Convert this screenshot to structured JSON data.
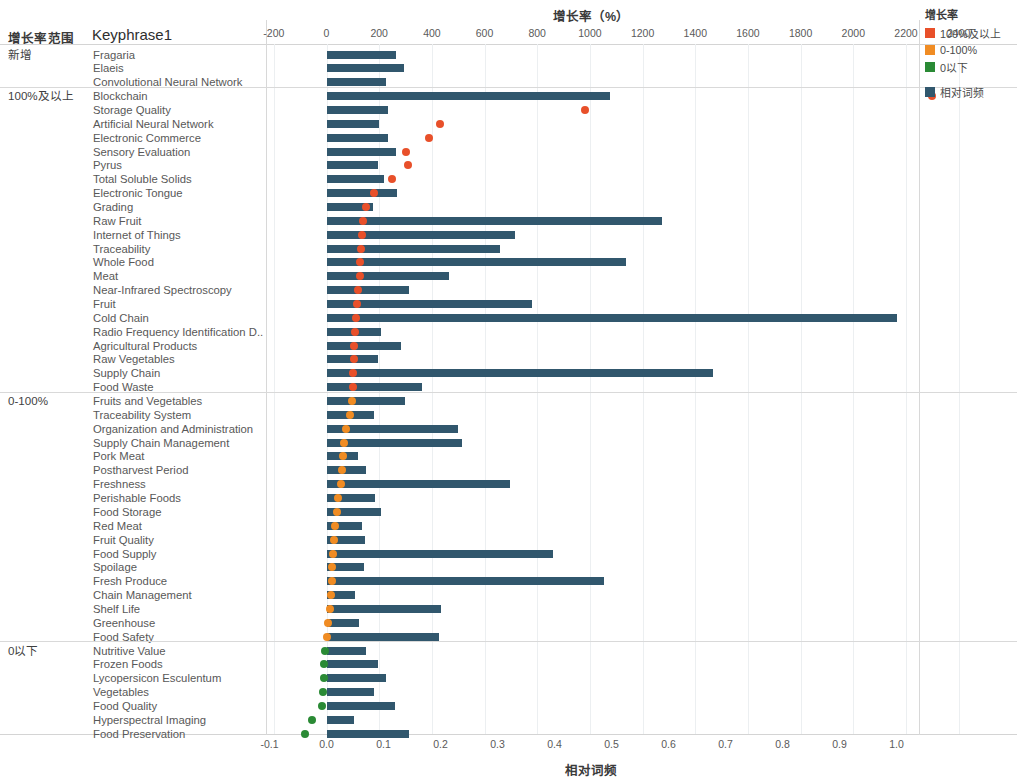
{
  "header": {
    "group_column_title": "增长率范围",
    "keyphrase_column_title": "Keyphrase1"
  },
  "legend": {
    "title": "增长率",
    "items": [
      {
        "label": "100%及以上",
        "color": "#e8502a"
      },
      {
        "label": "0-100%",
        "color": "#f08c23"
      },
      {
        "label": "0以下",
        "color": "#2a8a35"
      },
      {
        "label": "相对词频",
        "color": "#31576d"
      }
    ]
  },
  "chart_data": {
    "type": "bar",
    "title": "",
    "xlabel": "相对词频",
    "x2label": "增长率（%）",
    "ylabel": "Keyphrase1",
    "grid": true,
    "legend_position": "right",
    "top_axis": {
      "title": "增长率（%）",
      "ticks": [
        -200,
        0,
        200,
        400,
        600,
        800,
        1000,
        1200,
        1400,
        1600,
        1800,
        2000,
        2200,
        2400
      ],
      "tick_labels": [
        "-200",
        "0",
        "200",
        "400",
        "600",
        "800",
        "1000",
        "1200",
        "1400",
        "1600",
        "1800",
        "2000",
        "2200",
        "2400"
      ],
      "range": [
        -200,
        2400
      ]
    },
    "bottom_axis": {
      "title": "相对词频",
      "ticks": [
        -0.1,
        0.0,
        0.1,
        0.2,
        0.3,
        0.4,
        0.5,
        0.6,
        0.7,
        0.8,
        0.9,
        1.0
      ],
      "tick_labels": [
        "-0.1",
        "0.0",
        "0.1",
        "0.2",
        "0.3",
        "0.4",
        "0.5",
        "0.6",
        "0.7",
        "0.8",
        "0.9",
        "1.0"
      ],
      "range": [
        -0.1,
        1.0
      ]
    },
    "series": [
      {
        "name": "相对词频",
        "type": "bar",
        "color": "#31576d"
      },
      {
        "name": "增长率",
        "type": "scatter"
      }
    ],
    "groups": [
      {
        "label": "新增",
        "rows": [
          {
            "keyphrase": "Fragaria",
            "freq": 0.122,
            "growth": null,
            "growth_class": "new"
          },
          {
            "keyphrase": "Elaeis",
            "freq": 0.135,
            "growth": null,
            "growth_class": "new"
          },
          {
            "keyphrase": "Convolutional Neural Network",
            "freq": 0.104,
            "growth": null,
            "growth_class": "new"
          }
        ]
      },
      {
        "label": "100%及以上",
        "rows": [
          {
            "keyphrase": "Blockchain",
            "freq": 0.497,
            "growth": 2300,
            "growth_class": "high"
          },
          {
            "keyphrase": "Storage Quality",
            "freq": 0.107,
            "growth": 980,
            "growth_class": "high"
          },
          {
            "keyphrase": "Artificial Neural Network",
            "freq": 0.092,
            "growth": 430,
            "growth_class": "high"
          },
          {
            "keyphrase": "Electronic Commerce",
            "freq": 0.108,
            "growth": 390,
            "growth_class": "high"
          },
          {
            "keyphrase": "Sensory Evaluation",
            "freq": 0.122,
            "growth": 300,
            "growth_class": "high"
          },
          {
            "keyphrase": "Pyrus",
            "freq": 0.09,
            "growth": 310,
            "growth_class": "high"
          },
          {
            "keyphrase": "Total Soluble Solids",
            "freq": 0.1,
            "growth": 250,
            "growth_class": "high"
          },
          {
            "keyphrase": "Electronic Tongue",
            "freq": 0.123,
            "growth": 180,
            "growth_class": "high"
          },
          {
            "keyphrase": "Grading",
            "freq": 0.082,
            "growth": 150,
            "growth_class": "high"
          },
          {
            "keyphrase": "Raw Fruit",
            "freq": 0.588,
            "growth": 140,
            "growth_class": "high"
          },
          {
            "keyphrase": "Internet of Things",
            "freq": 0.33,
            "growth": 135,
            "growth_class": "high"
          },
          {
            "keyphrase": "Traceability",
            "freq": 0.305,
            "growth": 130,
            "growth_class": "high"
          },
          {
            "keyphrase": "Whole Food",
            "freq": 0.525,
            "growth": 128,
            "growth_class": "high"
          },
          {
            "keyphrase": "Meat",
            "freq": 0.215,
            "growth": 126,
            "growth_class": "high"
          },
          {
            "keyphrase": "Near-Infrared Spectroscopy",
            "freq": 0.145,
            "growth": 120,
            "growth_class": "high"
          },
          {
            "keyphrase": "Fruit",
            "freq": 0.36,
            "growth": 116,
            "growth_class": "high"
          },
          {
            "keyphrase": "Cold Chain",
            "freq": 1.0,
            "growth": 112,
            "growth_class": "high"
          },
          {
            "keyphrase": "Radio Frequency Identification D..",
            "freq": 0.095,
            "growth": 108,
            "growth_class": "high"
          },
          {
            "keyphrase": "Agricultural Products",
            "freq": 0.13,
            "growth": 106,
            "growth_class": "high"
          },
          {
            "keyphrase": "Raw Vegetables",
            "freq": 0.09,
            "growth": 104,
            "growth_class": "high"
          },
          {
            "keyphrase": "Supply Chain",
            "freq": 0.678,
            "growth": 102,
            "growth_class": "high"
          },
          {
            "keyphrase": "Food Waste",
            "freq": 0.168,
            "growth": 101,
            "growth_class": "high"
          }
        ]
      },
      {
        "label": "0-100%",
        "rows": [
          {
            "keyphrase": "Fruits and Vegetables",
            "freq": 0.137,
            "growth": 95,
            "growth_class": "mid"
          },
          {
            "keyphrase": "Traceability System",
            "freq": 0.083,
            "growth": 90,
            "growth_class": "mid"
          },
          {
            "keyphrase": "Organization and Administration",
            "freq": 0.23,
            "growth": 72,
            "growth_class": "mid"
          },
          {
            "keyphrase": "Supply Chain Management",
            "freq": 0.238,
            "growth": 65,
            "growth_class": "mid"
          },
          {
            "keyphrase": "Pork Meat",
            "freq": 0.055,
            "growth": 62,
            "growth_class": "mid"
          },
          {
            "keyphrase": "Postharvest Period",
            "freq": 0.07,
            "growth": 57,
            "growth_class": "mid"
          },
          {
            "keyphrase": "Freshness",
            "freq": 0.322,
            "growth": 53,
            "growth_class": "mid"
          },
          {
            "keyphrase": "Perishable Foods",
            "freq": 0.085,
            "growth": 44,
            "growth_class": "mid"
          },
          {
            "keyphrase": "Food Storage",
            "freq": 0.095,
            "growth": 40,
            "growth_class": "mid"
          },
          {
            "keyphrase": "Red Meat",
            "freq": 0.063,
            "growth": 32,
            "growth_class": "mid"
          },
          {
            "keyphrase": "Fruit Quality",
            "freq": 0.067,
            "growth": 28,
            "growth_class": "mid"
          },
          {
            "keyphrase": "Food Supply",
            "freq": 0.398,
            "growth": 25,
            "growth_class": "mid"
          },
          {
            "keyphrase": "Spoilage",
            "freq": 0.065,
            "growth": 22,
            "growth_class": "mid"
          },
          {
            "keyphrase": "Fresh Produce",
            "freq": 0.487,
            "growth": 20,
            "growth_class": "mid"
          },
          {
            "keyphrase": "Chain Management",
            "freq": 0.05,
            "growth": 16,
            "growth_class": "mid"
          },
          {
            "keyphrase": "Shelf Life",
            "freq": 0.2,
            "growth": 12,
            "growth_class": "mid"
          },
          {
            "keyphrase": "Greenhouse",
            "freq": 0.057,
            "growth": 5,
            "growth_class": "mid"
          },
          {
            "keyphrase": "Food Safety",
            "freq": 0.198,
            "growth": 3,
            "growth_class": "mid"
          }
        ]
      },
      {
        "label": "0以下",
        "rows": [
          {
            "keyphrase": "Nutritive Value",
            "freq": 0.07,
            "growth": -5,
            "growth_class": "low"
          },
          {
            "keyphrase": "Frozen Foods",
            "freq": 0.09,
            "growth": -8,
            "growth_class": "low"
          },
          {
            "keyphrase": "Lycopersicon Esculentum",
            "freq": 0.105,
            "growth": -10,
            "growth_class": "low"
          },
          {
            "keyphrase": "Vegetables",
            "freq": 0.083,
            "growth": -12,
            "growth_class": "low"
          },
          {
            "keyphrase": "Food Quality",
            "freq": 0.12,
            "growth": -18,
            "growth_class": "low"
          },
          {
            "keyphrase": "Hyperspectral Imaging",
            "freq": 0.048,
            "growth": -55,
            "growth_class": "low"
          },
          {
            "keyphrase": "Food Preservation",
            "freq": 0.145,
            "growth": -80,
            "growth_class": "low"
          }
        ]
      }
    ]
  }
}
